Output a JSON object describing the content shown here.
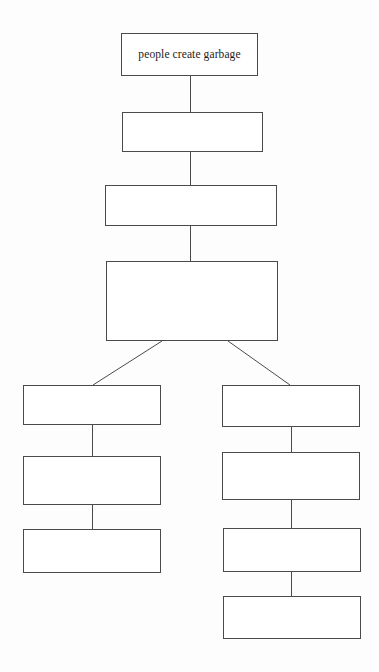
{
  "diagram": {
    "type": "flowchart",
    "orientation": "top-down",
    "background_color": "#fdfdfd",
    "box_border_color": "#4a4a4a",
    "box_fill_color": "#ffffff",
    "connector_color": "#4a4a4a",
    "text_color": "#1c1c1c",
    "nodes": [
      {
        "id": "node-1",
        "label": "people create garbage",
        "column": "center",
        "x": 121,
        "y": 33,
        "width": 137,
        "height": 43,
        "empty": false
      },
      {
        "id": "node-2",
        "label": "",
        "column": "center",
        "x": 122,
        "y": 112,
        "width": 141,
        "height": 40,
        "empty": true
      },
      {
        "id": "node-3",
        "label": "",
        "column": "center",
        "x": 105,
        "y": 185,
        "width": 172,
        "height": 41,
        "empty": true
      },
      {
        "id": "node-4",
        "label": "",
        "column": "center",
        "x": 106,
        "y": 261,
        "width": 172,
        "height": 80,
        "empty": true
      },
      {
        "id": "node-left-1",
        "label": "",
        "column": "left",
        "x": 23,
        "y": 385,
        "width": 138,
        "height": 40,
        "empty": true
      },
      {
        "id": "node-left-2",
        "label": "",
        "column": "left",
        "x": 23,
        "y": 456,
        "width": 138,
        "height": 49,
        "empty": true
      },
      {
        "id": "node-left-3",
        "label": "",
        "column": "left",
        "x": 23,
        "y": 529,
        "width": 138,
        "height": 44,
        "empty": true
      },
      {
        "id": "node-right-1",
        "label": "",
        "column": "right",
        "x": 222,
        "y": 385,
        "width": 138,
        "height": 42,
        "empty": true
      },
      {
        "id": "node-right-2",
        "label": "",
        "column": "right",
        "x": 222,
        "y": 452,
        "width": 138,
        "height": 48,
        "empty": true
      },
      {
        "id": "node-right-3",
        "label": "",
        "column": "right",
        "x": 223,
        "y": 528,
        "width": 138,
        "height": 44,
        "empty": true
      },
      {
        "id": "node-right-4",
        "label": "",
        "column": "right",
        "x": 223,
        "y": 596,
        "width": 138,
        "height": 43,
        "empty": true
      }
    ],
    "connectors": [
      {
        "id": "conn-1-2",
        "from": "node-1",
        "to": "node-2",
        "kind": "vertical",
        "x1": 190,
        "y1": 76,
        "x2": 190,
        "y2": 112
      },
      {
        "id": "conn-2-3",
        "from": "node-2",
        "to": "node-3",
        "kind": "vertical",
        "x1": 190,
        "y1": 152,
        "x2": 190,
        "y2": 185
      },
      {
        "id": "conn-3-4",
        "from": "node-3",
        "to": "node-4",
        "kind": "vertical",
        "x1": 190,
        "y1": 226,
        "x2": 190,
        "y2": 261
      },
      {
        "id": "conn-4-left",
        "from": "node-4",
        "to": "node-left-1",
        "kind": "diagonal",
        "x1": 162,
        "y1": 341,
        "x2": 93,
        "y2": 385
      },
      {
        "id": "conn-4-right",
        "from": "node-4",
        "to": "node-right-1",
        "kind": "diagonal",
        "x1": 228,
        "y1": 341,
        "x2": 290,
        "y2": 385
      },
      {
        "id": "conn-left-1-2",
        "from": "node-left-1",
        "to": "node-left-2",
        "kind": "vertical",
        "x1": 92,
        "y1": 425,
        "x2": 92,
        "y2": 456
      },
      {
        "id": "conn-left-2-3",
        "from": "node-left-2",
        "to": "node-left-3",
        "kind": "vertical",
        "x1": 92,
        "y1": 505,
        "x2": 92,
        "y2": 529
      },
      {
        "id": "conn-right-1-2",
        "from": "node-right-1",
        "to": "node-right-2",
        "kind": "vertical",
        "x1": 291,
        "y1": 427,
        "x2": 291,
        "y2": 452
      },
      {
        "id": "conn-right-2-3",
        "from": "node-right-2",
        "to": "node-right-3",
        "kind": "vertical",
        "x1": 291,
        "y1": 500,
        "x2": 291,
        "y2": 528
      },
      {
        "id": "conn-right-3-4",
        "from": "node-right-3",
        "to": "node-right-4",
        "kind": "vertical",
        "x1": 291,
        "y1": 572,
        "x2": 291,
        "y2": 596
      }
    ]
  }
}
